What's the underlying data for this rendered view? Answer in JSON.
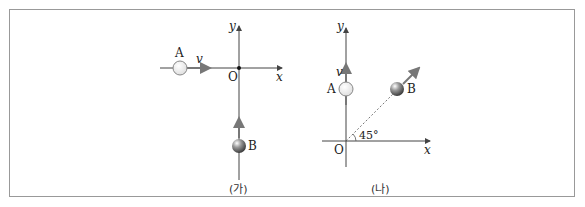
{
  "panels": [
    {
      "caption": "(가)",
      "axes": {
        "x_label": "x",
        "y_label": "y",
        "origin_label": "O"
      },
      "objects": [
        {
          "name": "A",
          "velocity_label": "v",
          "direction": "+x"
        },
        {
          "name": "B",
          "direction": "+y"
        }
      ]
    },
    {
      "caption": "(나)",
      "axes": {
        "x_label": "x",
        "y_label": "y",
        "origin_label": "O"
      },
      "objects": [
        {
          "name": "A",
          "velocity_label": "v",
          "direction": "+y"
        },
        {
          "name": "B",
          "direction": "45° from +x"
        }
      ],
      "angle_label": "45°"
    }
  ],
  "colors": {
    "axis": "#444444",
    "arrow": "#777777",
    "frame": "#999999"
  }
}
